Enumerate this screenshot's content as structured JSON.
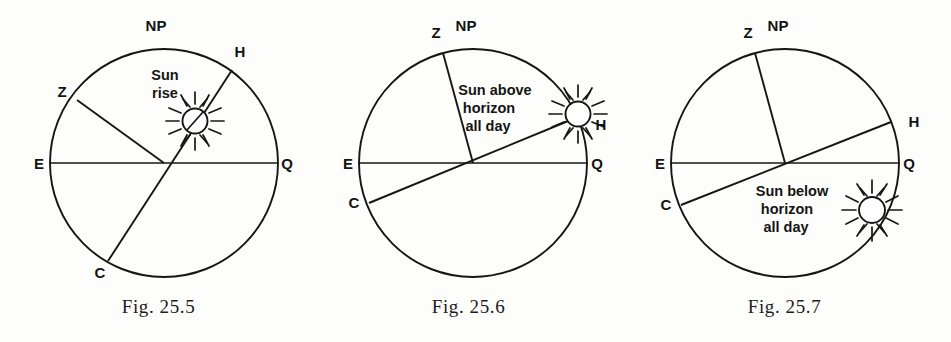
{
  "plate": {
    "background_color": "#fdfdfb",
    "ink_color": "#161616"
  },
  "figures": [
    {
      "id": "fig-25-5",
      "caption": "Fig. 25.5",
      "annotation_lines": [
        "Sun",
        "rise"
      ],
      "labels": {
        "north_pole": "NP",
        "zenith": "Z",
        "horizon": "H",
        "celestial_point": "C",
        "east": "E",
        "equator": "Q"
      },
      "sun_state": "on-horizon"
    },
    {
      "id": "fig-25-6",
      "caption": "Fig. 25.6",
      "annotation_lines": [
        "Sun above",
        "horizon",
        "all day"
      ],
      "labels": {
        "north_pole": "NP",
        "zenith": "Z",
        "horizon": "H",
        "celestial_point": "C",
        "east": "E",
        "equator": "Q"
      },
      "sun_state": "above-horizon"
    },
    {
      "id": "fig-25-7",
      "caption": "Fig. 25.7",
      "annotation_lines": [
        "Sun below",
        "horizon",
        "all  day"
      ],
      "labels": {
        "north_pole": "NP",
        "zenith": "Z",
        "horizon": "H",
        "celestial_point": "C",
        "east": "E",
        "equator": "Q"
      },
      "sun_state": "below-horizon"
    }
  ]
}
